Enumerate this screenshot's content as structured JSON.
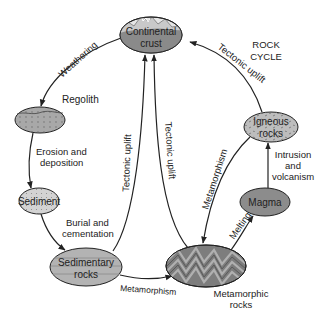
{
  "title": {
    "line1": "ROCK",
    "line2": "CYCLE"
  },
  "nodes": {
    "continental_crust": {
      "line1": "Continental",
      "line2": "crust"
    },
    "regolith": {
      "label": "Regolith"
    },
    "sediment": {
      "label": "Sediment"
    },
    "sedimentary_rocks": {
      "line1": "Sedimentary",
      "line2": "rocks"
    },
    "metamorphic_rocks": {
      "line1": "Metamorphic",
      "line2": "rocks"
    },
    "magma": {
      "label": "Magma"
    },
    "igneous_rocks": {
      "line1": "Igneous",
      "line2": "rocks"
    }
  },
  "processes": {
    "weathering": "Weathering",
    "erosion": {
      "line1": "Erosion and",
      "line2": "deposition"
    },
    "burial": {
      "line1": "Burial and",
      "line2": "cementation"
    },
    "metamorphism_bottom": "Metamorphism",
    "tectonic_uplift_sed": "Tectonic uplift",
    "tectonic_uplift_meta": "Tectonic uplift",
    "tectonic_uplift_ign": "Tectonic uplift",
    "metamorphism_ign": "Metamorphism",
    "melting": "Melting",
    "intrusion": {
      "line1": "Intrusion",
      "line2": "and",
      "line3": "volcanism"
    }
  },
  "colors": {
    "crust_fill": "#8a8a8a",
    "mountain_fill": "#c9c9c9",
    "sky_fill": "#e6e6e6",
    "regolith_fill": "#a8a8a8",
    "sediment_fill": "#cfcfcf",
    "sedimentary_fill": "#b3b3b3",
    "metamorphic_fill": "#7d7d7d",
    "magma_fill": "#8c8c8c",
    "igneous_fill": "#bdbdbd",
    "stroke": "#222222"
  }
}
